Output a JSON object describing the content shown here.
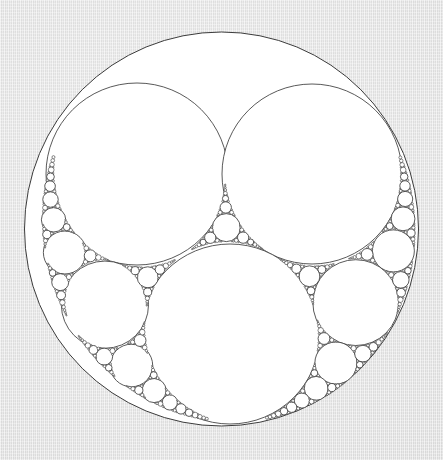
{
  "figure": {
    "title": "Apollonian Gasket",
    "type": "circle-packing-fractal",
    "caption": ""
  },
  "canvas": {
    "width": 443,
    "height": 460,
    "background_color": "#e5e5e5",
    "background_texture": "woven-paper-striation"
  },
  "style": {
    "stroke_color": "#3b3b3b",
    "stroke_width": 0.85,
    "fill_color": "#ffffff",
    "outer_fill_color": "#ffffff"
  },
  "chart_data": {
    "type": "scatter",
    "title": "Apollonian Gasket",
    "xlabel": "",
    "ylabel": "",
    "grid": false,
    "legend": "none",
    "xlim": [
      0,
      443
    ],
    "ylim": [
      0,
      460
    ],
    "generator": {
      "method": "descartes-circle-theorem",
      "max_depth": 11,
      "min_radius_px": 0.55
    },
    "seed_circles": [
      {
        "name": "outer-boundary",
        "cx": 221.5,
        "cy": 229.0,
        "r": 197.0,
        "curvature": -1,
        "bounding": true
      },
      {
        "name": "left-large-circle",
        "cx": 137.0,
        "cy": 174.0,
        "r": 91.0,
        "curvature": 2.164
      },
      {
        "name": "right-large-circle",
        "cx": 312.0,
        "cy": 174.0,
        "r": 90.0,
        "curvature": 2.189
      },
      {
        "name": "bottom-large-circle",
        "cx": 230.0,
        "cy": 334.0,
        "r": 90.0,
        "curvature": 2.189
      }
    ],
    "notable_circles": [
      {
        "name": "top-medium-circle",
        "cx": 228,
        "cy": 70,
        "r": 37
      },
      {
        "name": "lower-left-medium-circle",
        "cx": 89,
        "cy": 306,
        "r": 43
      },
      {
        "name": "lower-right-medium-circle",
        "cx": 356,
        "cy": 304,
        "r": 40
      },
      {
        "name": "central-small-circle",
        "cx": 224,
        "cy": 227,
        "r": 15
      }
    ],
    "outer_bounds": {
      "left": 25,
      "right": 418,
      "top": 32,
      "bottom": 426
    }
  }
}
